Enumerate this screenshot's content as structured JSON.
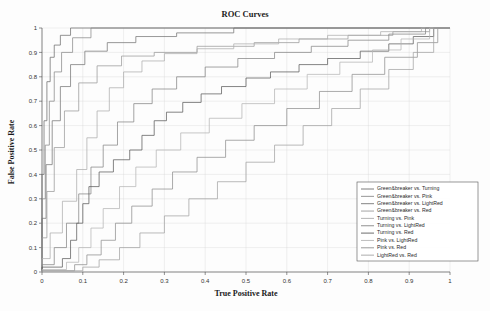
{
  "chart_data": {
    "type": "line",
    "title": "ROC Curves",
    "xlabel": "True Positive Rate",
    "ylabel": "False Positive Rate",
    "xlim": [
      0,
      1
    ],
    "ylim": [
      0,
      1
    ],
    "xticks": [
      "0",
      "0.1",
      "0.2",
      "0.3",
      "0.4",
      "0.5",
      "0.6",
      "0.7",
      "0.8",
      "0.9",
      "1"
    ],
    "yticks": [
      "0",
      "0.1",
      "0.2",
      "0.3",
      "0.4",
      "0.5",
      "0.6",
      "0.7",
      "0.8",
      "0.9",
      "1"
    ],
    "grid": true,
    "legend_position": "lower-right",
    "series": [
      {
        "name": "Green&breaker vs. Turning",
        "color": "#6f6f6f",
        "points": [
          [
            0,
            0
          ],
          [
            0,
            0.4
          ],
          [
            0.005,
            0.4
          ],
          [
            0.005,
            0.62
          ],
          [
            0.012,
            0.62
          ],
          [
            0.012,
            0.78
          ],
          [
            0.02,
            0.78
          ],
          [
            0.02,
            0.88
          ],
          [
            0.03,
            0.88
          ],
          [
            0.03,
            0.93
          ],
          [
            0.045,
            0.93
          ],
          [
            0.045,
            0.97
          ],
          [
            0.07,
            0.97
          ],
          [
            0.07,
            1.0
          ],
          [
            1.0,
            1.0
          ]
        ]
      },
      {
        "name": "Green&breaker vs. Pink",
        "color": "#8a8a8a",
        "points": [
          [
            0,
            0
          ],
          [
            0,
            0.3
          ],
          [
            0.008,
            0.3
          ],
          [
            0.008,
            0.52
          ],
          [
            0.018,
            0.52
          ],
          [
            0.018,
            0.7
          ],
          [
            0.03,
            0.7
          ],
          [
            0.03,
            0.82
          ],
          [
            0.048,
            0.82
          ],
          [
            0.048,
            0.9
          ],
          [
            0.075,
            0.9
          ],
          [
            0.075,
            0.96
          ],
          [
            0.12,
            0.96
          ],
          [
            0.12,
            1.0
          ],
          [
            1.0,
            1.0
          ]
        ]
      },
      {
        "name": "Green&breaker vs. LightRed",
        "color": "#777777",
        "points": [
          [
            0,
            0
          ],
          [
            0,
            0.22
          ],
          [
            0.01,
            0.22
          ],
          [
            0.01,
            0.44
          ],
          [
            0.025,
            0.44
          ],
          [
            0.025,
            0.62
          ],
          [
            0.045,
            0.62
          ],
          [
            0.045,
            0.76
          ],
          [
            0.07,
            0.76
          ],
          [
            0.07,
            0.85
          ],
          [
            0.105,
            0.85
          ],
          [
            0.105,
            0.905
          ],
          [
            0.16,
            0.905
          ],
          [
            0.16,
            0.94
          ],
          [
            0.23,
            0.94
          ],
          [
            0.23,
            0.965
          ],
          [
            0.33,
            0.965
          ],
          [
            0.33,
            0.98
          ],
          [
            0.47,
            0.98
          ],
          [
            0.47,
            1.0
          ],
          [
            1.0,
            1.0
          ]
        ]
      },
      {
        "name": "Green&breaker vs. Red",
        "color": "#9a9a9a",
        "points": [
          [
            0,
            0
          ],
          [
            0,
            0.14
          ],
          [
            0.012,
            0.14
          ],
          [
            0.012,
            0.33
          ],
          [
            0.03,
            0.33
          ],
          [
            0.03,
            0.51
          ],
          [
            0.055,
            0.51
          ],
          [
            0.055,
            0.66
          ],
          [
            0.09,
            0.66
          ],
          [
            0.09,
            0.775
          ],
          [
            0.135,
            0.775
          ],
          [
            0.135,
            0.845
          ],
          [
            0.195,
            0.845
          ],
          [
            0.195,
            0.885
          ],
          [
            0.275,
            0.885
          ],
          [
            0.275,
            0.9
          ],
          [
            0.38,
            0.9
          ],
          [
            0.38,
            0.925
          ],
          [
            0.52,
            0.925
          ],
          [
            0.52,
            0.94
          ],
          [
            0.63,
            0.94
          ],
          [
            0.63,
            0.955
          ],
          [
            0.75,
            0.955
          ],
          [
            0.75,
            0.97
          ],
          [
            0.86,
            0.97
          ],
          [
            0.86,
            0.985
          ],
          [
            0.95,
            0.985
          ],
          [
            0.95,
            1.0
          ],
          [
            1.0,
            1.0
          ]
        ]
      },
      {
        "name": "Turning vs. Pink",
        "color": "#adadad",
        "points": [
          [
            0,
            0
          ],
          [
            0,
            0.055
          ],
          [
            0.02,
            0.055
          ],
          [
            0.02,
            0.16
          ],
          [
            0.05,
            0.16
          ],
          [
            0.05,
            0.29
          ],
          [
            0.085,
            0.29
          ],
          [
            0.085,
            0.42
          ],
          [
            0.11,
            0.42
          ],
          [
            0.11,
            0.55
          ],
          [
            0.135,
            0.55
          ],
          [
            0.135,
            0.66
          ],
          [
            0.165,
            0.66
          ],
          [
            0.165,
            0.755
          ],
          [
            0.2,
            0.755
          ],
          [
            0.2,
            0.82
          ],
          [
            0.245,
            0.82
          ],
          [
            0.245,
            0.865
          ],
          [
            0.3,
            0.865
          ],
          [
            0.3,
            0.895
          ],
          [
            0.38,
            0.895
          ],
          [
            0.38,
            0.915
          ],
          [
            0.47,
            0.915
          ],
          [
            0.47,
            0.935
          ],
          [
            0.58,
            0.935
          ],
          [
            0.58,
            0.955
          ],
          [
            0.7,
            0.955
          ],
          [
            0.7,
            0.97
          ],
          [
            0.83,
            0.97
          ],
          [
            0.83,
            0.985
          ],
          [
            0.93,
            0.985
          ],
          [
            0.93,
            1.0
          ],
          [
            1.0,
            1.0
          ]
        ]
      },
      {
        "name": "Turning vs. LightRed",
        "color": "#858585",
        "points": [
          [
            0,
            0
          ],
          [
            0,
            0.03
          ],
          [
            0.03,
            0.03
          ],
          [
            0.03,
            0.1
          ],
          [
            0.06,
            0.1
          ],
          [
            0.06,
            0.2
          ],
          [
            0.09,
            0.2
          ],
          [
            0.09,
            0.32
          ],
          [
            0.12,
            0.32
          ],
          [
            0.12,
            0.43
          ],
          [
            0.15,
            0.43
          ],
          [
            0.15,
            0.52
          ],
          [
            0.185,
            0.52
          ],
          [
            0.185,
            0.615
          ],
          [
            0.225,
            0.615
          ],
          [
            0.225,
            0.69
          ],
          [
            0.27,
            0.69
          ],
          [
            0.27,
            0.75
          ],
          [
            0.33,
            0.75
          ],
          [
            0.33,
            0.8
          ],
          [
            0.4,
            0.8
          ],
          [
            0.4,
            0.84
          ],
          [
            0.48,
            0.84
          ],
          [
            0.48,
            0.875
          ],
          [
            0.57,
            0.875
          ],
          [
            0.57,
            0.9
          ],
          [
            0.66,
            0.9
          ],
          [
            0.66,
            0.925
          ],
          [
            0.75,
            0.925
          ],
          [
            0.75,
            0.95
          ],
          [
            0.85,
            0.95
          ],
          [
            0.85,
            0.975
          ],
          [
            0.94,
            0.975
          ],
          [
            0.94,
            1.0
          ],
          [
            1.0,
            1.0
          ]
        ]
      },
      {
        "name": "Turning vs. Red",
        "color": "#5c5c5c",
        "points": [
          [
            0,
            0
          ],
          [
            0,
            0.02
          ],
          [
            0.05,
            0.02
          ],
          [
            0.05,
            0.055
          ],
          [
            0.07,
            0.055
          ],
          [
            0.07,
            0.13
          ],
          [
            0.085,
            0.13
          ],
          [
            0.085,
            0.2
          ],
          [
            0.1,
            0.2
          ],
          [
            0.1,
            0.28
          ],
          [
            0.115,
            0.28
          ],
          [
            0.115,
            0.35
          ],
          [
            0.14,
            0.35
          ],
          [
            0.14,
            0.41
          ],
          [
            0.175,
            0.41
          ],
          [
            0.175,
            0.46
          ],
          [
            0.215,
            0.46
          ],
          [
            0.215,
            0.5
          ],
          [
            0.245,
            0.5
          ],
          [
            0.245,
            0.56
          ],
          [
            0.275,
            0.56
          ],
          [
            0.275,
            0.62
          ],
          [
            0.305,
            0.62
          ],
          [
            0.305,
            0.655
          ],
          [
            0.345,
            0.655
          ],
          [
            0.345,
            0.695
          ],
          [
            0.39,
            0.695
          ],
          [
            0.39,
            0.73
          ],
          [
            0.44,
            0.73
          ],
          [
            0.44,
            0.76
          ],
          [
            0.5,
            0.76
          ],
          [
            0.5,
            0.795
          ],
          [
            0.56,
            0.795
          ],
          [
            0.56,
            0.82
          ],
          [
            0.63,
            0.82
          ],
          [
            0.63,
            0.85
          ],
          [
            0.7,
            0.85
          ],
          [
            0.7,
            0.875
          ],
          [
            0.78,
            0.875
          ],
          [
            0.78,
            0.905
          ],
          [
            0.85,
            0.905
          ],
          [
            0.85,
            0.935
          ],
          [
            0.91,
            0.935
          ],
          [
            0.91,
            0.965
          ],
          [
            0.96,
            0.965
          ],
          [
            0.96,
            1.0
          ],
          [
            1.0,
            1.0
          ]
        ]
      },
      {
        "name": "Pink vs. LightRed",
        "color": "#b5b5b5",
        "points": [
          [
            0,
            0
          ],
          [
            0,
            0.01
          ],
          [
            0.06,
            0.01
          ],
          [
            0.06,
            0.04
          ],
          [
            0.09,
            0.04
          ],
          [
            0.09,
            0.1
          ],
          [
            0.12,
            0.1
          ],
          [
            0.12,
            0.18
          ],
          [
            0.15,
            0.18
          ],
          [
            0.15,
            0.26
          ],
          [
            0.19,
            0.26
          ],
          [
            0.19,
            0.35
          ],
          [
            0.23,
            0.35
          ],
          [
            0.23,
            0.43
          ],
          [
            0.28,
            0.43
          ],
          [
            0.28,
            0.5
          ],
          [
            0.34,
            0.5
          ],
          [
            0.34,
            0.57
          ],
          [
            0.41,
            0.57
          ],
          [
            0.41,
            0.63
          ],
          [
            0.49,
            0.63
          ],
          [
            0.49,
            0.69
          ],
          [
            0.57,
            0.69
          ],
          [
            0.57,
            0.75
          ],
          [
            0.65,
            0.75
          ],
          [
            0.65,
            0.81
          ],
          [
            0.73,
            0.81
          ],
          [
            0.73,
            0.86
          ],
          [
            0.81,
            0.86
          ],
          [
            0.81,
            0.91
          ],
          [
            0.88,
            0.91
          ],
          [
            0.88,
            0.955
          ],
          [
            0.95,
            0.955
          ],
          [
            0.95,
            1.0
          ],
          [
            1.0,
            1.0
          ]
        ]
      },
      {
        "name": "Pink vs. Red",
        "color": "#8f8f8f",
        "points": [
          [
            0,
            0
          ],
          [
            0,
            0.005
          ],
          [
            0.08,
            0.005
          ],
          [
            0.08,
            0.03
          ],
          [
            0.11,
            0.03
          ],
          [
            0.11,
            0.07
          ],
          [
            0.145,
            0.07
          ],
          [
            0.145,
            0.13
          ],
          [
            0.18,
            0.13
          ],
          [
            0.18,
            0.2
          ],
          [
            0.22,
            0.2
          ],
          [
            0.22,
            0.27
          ],
          [
            0.27,
            0.27
          ],
          [
            0.27,
            0.34
          ],
          [
            0.32,
            0.34
          ],
          [
            0.32,
            0.41
          ],
          [
            0.38,
            0.41
          ],
          [
            0.38,
            0.47
          ],
          [
            0.45,
            0.47
          ],
          [
            0.45,
            0.54
          ],
          [
            0.52,
            0.54
          ],
          [
            0.52,
            0.6
          ],
          [
            0.6,
            0.6
          ],
          [
            0.6,
            0.67
          ],
          [
            0.68,
            0.67
          ],
          [
            0.68,
            0.74
          ],
          [
            0.76,
            0.74
          ],
          [
            0.76,
            0.81
          ],
          [
            0.84,
            0.81
          ],
          [
            0.84,
            0.88
          ],
          [
            0.92,
            0.88
          ],
          [
            0.92,
            0.94
          ],
          [
            0.97,
            0.94
          ],
          [
            0.97,
            1.0
          ],
          [
            1.0,
            1.0
          ]
        ]
      },
      {
        "name": "LightRed vs. Red",
        "color": "#a3a3a3",
        "points": [
          [
            0,
            0
          ],
          [
            0,
            0.005
          ],
          [
            0.1,
            0.005
          ],
          [
            0.1,
            0.02
          ],
          [
            0.14,
            0.02
          ],
          [
            0.14,
            0.05
          ],
          [
            0.19,
            0.05
          ],
          [
            0.19,
            0.1
          ],
          [
            0.24,
            0.1
          ],
          [
            0.24,
            0.16
          ],
          [
            0.3,
            0.16
          ],
          [
            0.3,
            0.23
          ],
          [
            0.36,
            0.23
          ],
          [
            0.36,
            0.3
          ],
          [
            0.43,
            0.3
          ],
          [
            0.43,
            0.37
          ],
          [
            0.5,
            0.37
          ],
          [
            0.5,
            0.45
          ],
          [
            0.57,
            0.45
          ],
          [
            0.57,
            0.52
          ],
          [
            0.64,
            0.52
          ],
          [
            0.64,
            0.6
          ],
          [
            0.71,
            0.6
          ],
          [
            0.71,
            0.67
          ],
          [
            0.78,
            0.67
          ],
          [
            0.78,
            0.75
          ],
          [
            0.85,
            0.75
          ],
          [
            0.85,
            0.83
          ],
          [
            0.91,
            0.83
          ],
          [
            0.91,
            0.9
          ],
          [
            0.96,
            0.9
          ],
          [
            0.96,
            1.0
          ],
          [
            1.0,
            1.0
          ]
        ]
      }
    ]
  }
}
